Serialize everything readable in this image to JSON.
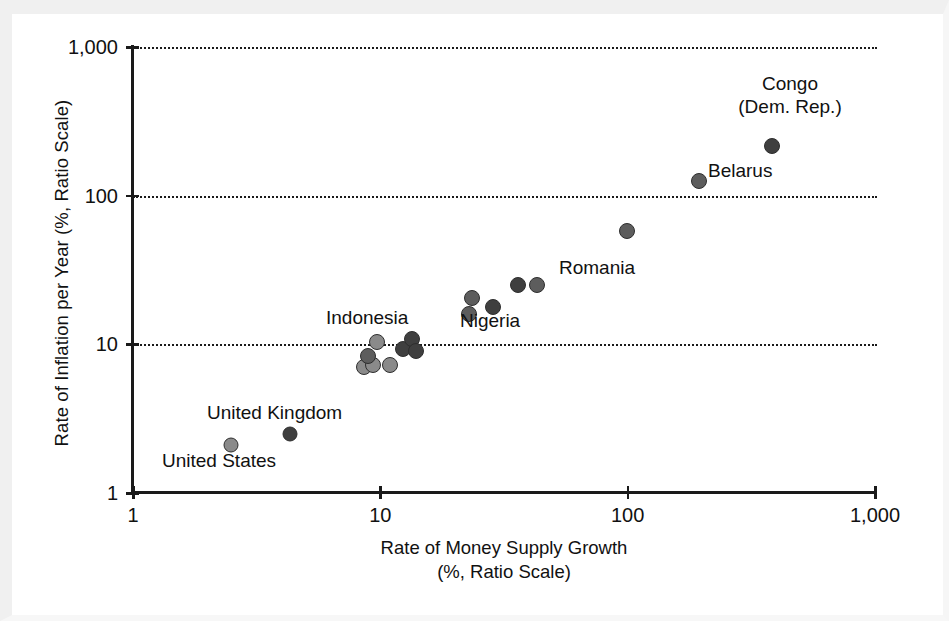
{
  "chart_data": {
    "type": "scatter",
    "title": "",
    "xlabel": "Rate of Money Supply Growth",
    "xlabel_line2": "(%, Ratio Scale)",
    "ylabel": "Rate of Inflation per Year (%, Ratio Scale)",
    "xscale": "log",
    "yscale": "log",
    "xlim": [
      1,
      1000
    ],
    "ylim": [
      1,
      1000
    ],
    "xticks": [
      1,
      10,
      100,
      1000
    ],
    "xtick_labels": [
      "1",
      "10",
      "100",
      "1,000"
    ],
    "yticks": [
      1,
      10,
      100,
      1000
    ],
    "ytick_labels": [
      "1",
      "10",
      "100",
      "1,000"
    ],
    "grid": "horizontal dotted at 10, 100, 1000",
    "legend": "none",
    "points": [
      {
        "name": "United States",
        "x": 2.5,
        "y": 2.1,
        "shade": "light",
        "r": 7.5
      },
      {
        "name": "United Kingdom",
        "x": 4.3,
        "y": 2.5,
        "shade": "dark",
        "r": 7.5
      },
      {
        "name": "",
        "x": 8.6,
        "y": 7.0,
        "shade": "light",
        "r": 8
      },
      {
        "name": "",
        "x": 9.3,
        "y": 7.3,
        "shade": "light",
        "r": 8
      },
      {
        "name": "",
        "x": 10.9,
        "y": 7.3,
        "shade": "light",
        "r": 8
      },
      {
        "name": "",
        "x": 8.9,
        "y": 8.4,
        "shade": "mid",
        "r": 8
      },
      {
        "name": "",
        "x": 9.7,
        "y": 10.4,
        "shade": "light",
        "r": 8
      },
      {
        "name": "",
        "x": 12.4,
        "y": 9.3,
        "shade": "dark",
        "r": 8
      },
      {
        "name": "",
        "x": 13.4,
        "y": 10.9,
        "shade": "dark",
        "r": 8
      },
      {
        "name": "",
        "x": 14.0,
        "y": 9.0,
        "shade": "dark",
        "r": 8
      },
      {
        "name": "",
        "x": 22.9,
        "y": 16.0,
        "shade": "mid",
        "r": 8
      },
      {
        "name": "",
        "x": 23.5,
        "y": 20.4,
        "shade": "mid",
        "r": 8
      },
      {
        "name": "",
        "x": 28.5,
        "y": 17.9,
        "shade": "dark",
        "r": 8
      },
      {
        "name": "",
        "x": 36.0,
        "y": 25.0,
        "shade": "dark",
        "r": 8
      },
      {
        "name": "Romania",
        "x": 43.0,
        "y": 25.0,
        "shade": "mid",
        "r": 8
      },
      {
        "name": "",
        "x": 99.0,
        "y": 58.0,
        "shade": "mid",
        "r": 8
      },
      {
        "name": "Belarus",
        "x": 195.0,
        "y": 125.0,
        "shade": "mid",
        "r": 8
      },
      {
        "name": "Congo (Dem. Rep.)",
        "x": 383.0,
        "y": 215.0,
        "shade": "dark",
        "r": 8
      }
    ],
    "annotations": [
      {
        "text": "Congo",
        "near": "Congo (Dem. Rep.)"
      },
      {
        "text": "(Dem. Rep.)",
        "near": "Congo (Dem. Rep.)"
      },
      {
        "text": "Belarus",
        "near": "Belarus"
      },
      {
        "text": "Romania",
        "near": "Romania"
      },
      {
        "text": "Nigeria",
        "near": "Nigeria cluster"
      },
      {
        "text": "Indonesia",
        "near": "Indonesia cluster"
      },
      {
        "text": "United Kingdom",
        "near": "United Kingdom"
      },
      {
        "text": "United States",
        "near": "United States"
      }
    ]
  },
  "axes": {
    "y_title": "Rate of Inflation per Year (%, Ratio Scale)",
    "x_title_line1": "Rate of Money Supply Growth",
    "x_title_line2": "(%, Ratio Scale)",
    "y_ticks": [
      "1,000",
      "100",
      "10",
      "1"
    ],
    "x_ticks": [
      "1",
      "10",
      "100",
      "1,000"
    ]
  },
  "labels": {
    "congo_line1": "Congo",
    "congo_line2": "(Dem. Rep.)",
    "belarus": "Belarus",
    "romania": "Romania",
    "nigeria": "Nigeria",
    "indonesia": "Indonesia",
    "united_kingdom": "United Kingdom",
    "united_states": "United States"
  },
  "colors": {
    "ink": "#1a1a1a",
    "dot_dark": "#3f3f3f",
    "dot_mid": "#5d5d5d",
    "dot_light": "#8a8a8a",
    "background": "#ffffff"
  }
}
